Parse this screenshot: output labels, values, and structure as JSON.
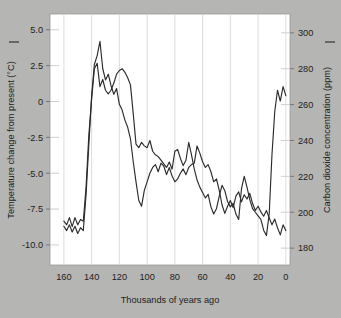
{
  "figure": {
    "background_color": "#b5b5b3",
    "plot_background_color": "#ffffff",
    "axis_text_color": "#1d1d1d",
    "grid_color": "#d8d8d8",
    "legend_dash_color": "#333333"
  },
  "chart_data": {
    "type": "line",
    "title": "",
    "xlabel": "Thousands of years ago",
    "ylabel": "Temperature change from present (°C)",
    "y2label": "Carbon dioxide concentration (ppm)",
    "xlim": [
      170,
      -3
    ],
    "xticks": [
      160,
      140,
      120,
      100,
      80,
      60,
      40,
      20,
      0
    ],
    "xticklabels": [
      "160",
      "140",
      "120",
      "100",
      "80",
      "60",
      "40",
      "20",
      "0"
    ],
    "ylim": [
      -11.4,
      6.1
    ],
    "yticks": [
      5.0,
      2.5,
      0,
      -2.5,
      -5.0,
      -7.5,
      -10.0
    ],
    "yticklabels": [
      "5.0",
      "2.5",
      "0",
      "-2.5",
      "-5.0",
      "-7.5",
      "-10.0"
    ],
    "y2lim": [
      170.6,
      310.5
    ],
    "y2ticks": [
      300,
      280,
      260,
      240,
      220,
      200,
      180
    ],
    "y2ticklabels": [
      "300",
      "280",
      "260",
      "240",
      "220",
      "200",
      "180"
    ],
    "grid": "vertical-gridlines-at-xticks",
    "legend_position": "inline-dash-beside-axis-titles",
    "series": [
      {
        "name": "Temperature change from present (°C)",
        "axis": "left",
        "color": "#2b2b2b",
        "x": [
          160,
          158,
          156,
          154,
          152,
          150,
          148,
          146,
          144,
          142,
          140,
          138,
          136,
          134,
          132,
          130,
          128,
          126,
          124,
          122,
          120,
          118,
          116,
          114,
          112,
          110,
          108,
          106,
          104,
          102,
          100,
          98,
          96,
          94,
          92,
          90,
          88,
          86,
          84,
          82,
          80,
          78,
          76,
          74,
          72,
          70,
          68,
          66,
          64,
          62,
          60,
          58,
          56,
          54,
          52,
          50,
          48,
          46,
          44,
          42,
          40,
          38,
          36,
          34,
          32,
          30,
          28,
          26,
          24,
          22,
          20,
          18,
          16,
          14,
          12,
          10,
          8,
          6,
          4,
          2,
          0
        ],
        "values": [
          -8.7,
          -9.0,
          -8.6,
          -9.1,
          -8.7,
          -9.2,
          -8.8,
          -9.0,
          -6.5,
          -3.0,
          0.4,
          2.6,
          3.2,
          4.2,
          2.3,
          1.5,
          1.9,
          1.1,
          0.5,
          0.9,
          -0.2,
          -0.6,
          -1.3,
          -1.8,
          -2.6,
          -4.2,
          -5.6,
          -6.9,
          -7.3,
          -6.2,
          -5.6,
          -5.0,
          -4.6,
          -4.4,
          -4.9,
          -4.3,
          -4.5,
          -5.1,
          -4.6,
          -5.2,
          -5.6,
          -5.4,
          -5.0,
          -4.7,
          -5.1,
          -4.6,
          -4.4,
          -4.3,
          -3.1,
          -3.6,
          -4.2,
          -4.6,
          -4.4,
          -4.9,
          -5.6,
          -5.4,
          -6.2,
          -7.2,
          -7.8,
          -7.3,
          -6.9,
          -7.4,
          -6.6,
          -6.3,
          -7.0,
          -6.5,
          -6.8,
          -6.4,
          -7.1,
          -7.6,
          -7.3,
          -7.7,
          -8.0,
          -7.6,
          -8.1,
          -8.6,
          -8.2,
          -8.8,
          -9.3,
          -8.6,
          -9.0
        ]
      },
      {
        "name": "Carbon dioxide concentration (ppm)",
        "axis": "right",
        "color": "#2b2b2b",
        "x": [
          160,
          158,
          156,
          154,
          152,
          150,
          148,
          146,
          144,
          142,
          140,
          138,
          136,
          134,
          132,
          130,
          128,
          126,
          124,
          122,
          120,
          118,
          116,
          114,
          112,
          110,
          108,
          106,
          104,
          102,
          100,
          98,
          96,
          94,
          92,
          90,
          88,
          86,
          84,
          82,
          80,
          78,
          76,
          74,
          72,
          70,
          68,
          66,
          64,
          62,
          60,
          58,
          56,
          54,
          52,
          50,
          48,
          46,
          44,
          42,
          40,
          38,
          36,
          34,
          32,
          30,
          28,
          26,
          24,
          22,
          20,
          18,
          16,
          14,
          12,
          10,
          8,
          6,
          4,
          2,
          0
        ],
        "values": [
          195,
          193,
          197,
          192,
          197,
          193,
          196,
          195,
          214,
          243,
          263,
          280,
          283,
          270,
          274,
          268,
          266,
          268,
          272,
          277,
          279,
          280,
          278,
          275,
          271,
          255,
          238,
          236,
          239,
          237,
          236,
          240,
          234,
          232,
          231,
          229,
          227,
          225,
          228,
          224,
          234,
          235,
          230,
          226,
          229,
          239,
          232,
          224,
          218,
          214,
          211,
          208,
          210,
          203,
          199,
          202,
          209,
          215,
          212,
          206,
          203,
          205,
          199,
          196,
          213,
          220,
          214,
          207,
          202,
          200,
          198,
          196,
          190,
          187,
          199,
          232,
          256,
          268,
          262,
          270,
          265
        ]
      }
    ],
    "annotations": [
      {
        "text": "sharp CO2 rise near present",
        "visible": false
      }
    ]
  }
}
